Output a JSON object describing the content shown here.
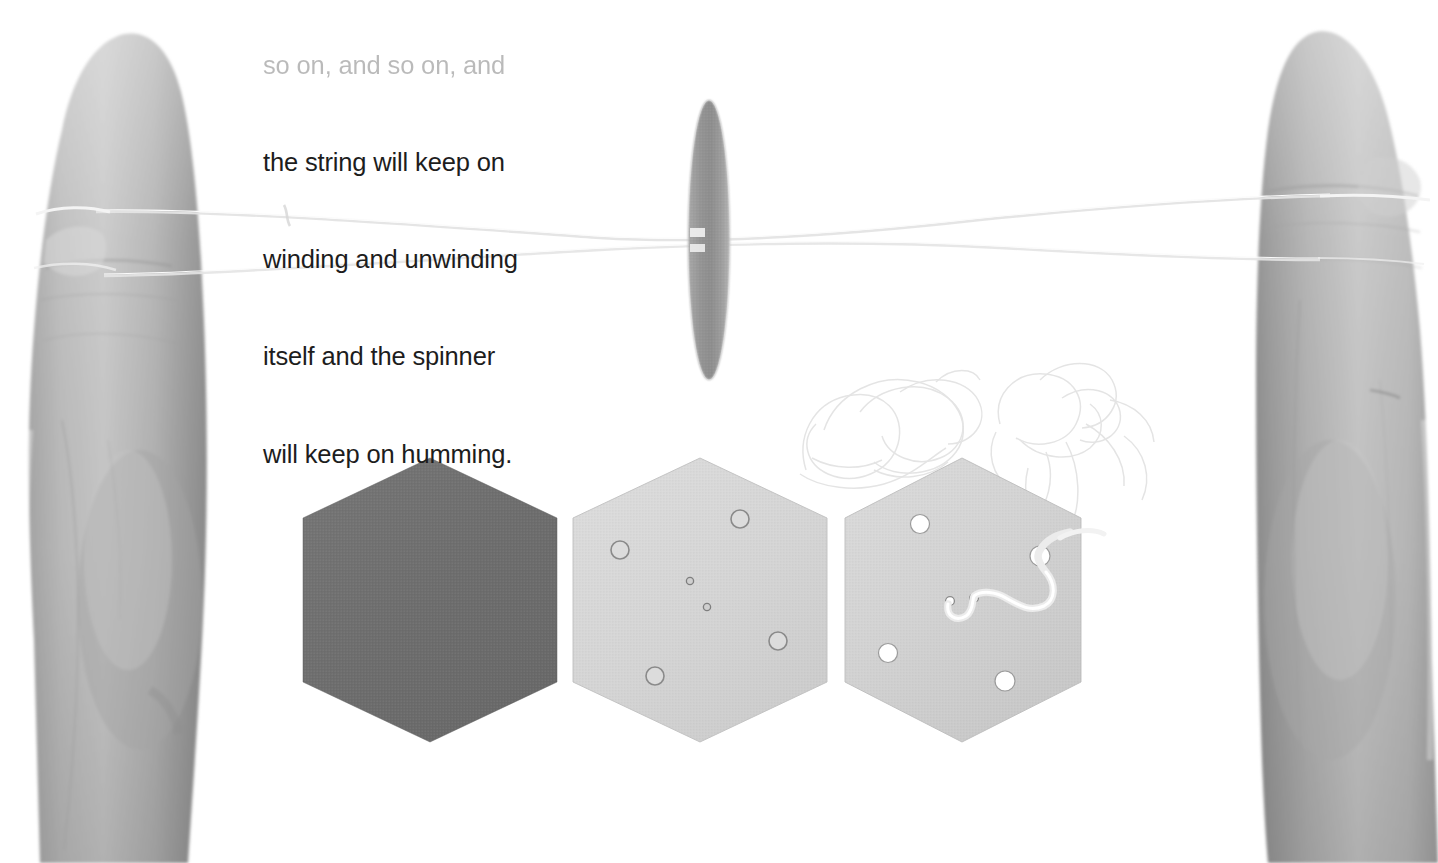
{
  "page": {
    "width": 1438,
    "height": 863,
    "background_color": "#ffffff",
    "kind": "photograph-with-caption"
  },
  "caption": {
    "name": "instruction-caption",
    "color": "#1d1d1d",
    "lines": [
      "the string will keep on",
      "winding and unwinding",
      "itself and the spinner",
      "will keep on humming."
    ],
    "clipped_top_line": "so on, and so on, and"
  },
  "scene": {
    "description": "Two hands holding a looped string; a motion-blurred hexagonal button spinner whirls at the centre; three hexagon cut-outs lie below.",
    "colors": {
      "background": "#ffffff",
      "skin": "#b3b3b3",
      "skin_shadow": "#8d8d8d",
      "skin_highlight": "#d2d2d2",
      "string": "#eeeeee",
      "string_dark": "#dcdcdc",
      "hex_dark": "#6e6e6e",
      "hex_light": "#d6d6d6",
      "hex_light_edge": "#c3c3c3",
      "spinner": "#9c9c9c",
      "hole_ring": "#8a8a8a",
      "hole_fill": "#ffffff"
    },
    "hands": [
      {
        "name": "left-hand",
        "side": "left",
        "x": 0,
        "y": 0,
        "width": 210,
        "height": 863,
        "string_wrap_y": [
          205,
          270
        ]
      },
      {
        "name": "right-hand",
        "side": "right",
        "x": 1248,
        "y": 0,
        "width": 190,
        "height": 863,
        "string_wrap_y": [
          196,
          262
        ]
      }
    ],
    "spinner": {
      "name": "spinning-hexagon-disc",
      "label": "motion-blurred spinning hexagon",
      "cx": 709,
      "cy": 240,
      "rx": 21,
      "ry": 140,
      "color": "#9c9c9c"
    },
    "string": {
      "name": "twisted-string",
      "upper_y_left": 207,
      "upper_y_right": 197,
      "lower_y_left": 272,
      "lower_y_right": 258,
      "color": "#ececec"
    },
    "tangle": {
      "name": "tangled-string-loops",
      "x": 790,
      "y": 365,
      "width": 320,
      "height": 210,
      "color": "#e8e8e8"
    },
    "hexagons": [
      {
        "name": "hexagon-dark-blank",
        "label": "dark grey hexagon, no holes",
        "cx": 430,
        "cy": 600,
        "rx": 127,
        "ry": 142,
        "fill": "#6e6e6e",
        "holes": [],
        "center_holes": [],
        "string_threaded": false
      },
      {
        "name": "hexagon-light-drilled",
        "label": "light grey hexagon with four ring holes and two pin holes",
        "cx": 700,
        "cy": 600,
        "rx": 127,
        "ry": 142,
        "fill": "#d6d6d6",
        "holes": [
          {
            "cx": 740,
            "cy": 519,
            "r": 9
          },
          {
            "cx": 620,
            "cy": 550,
            "r": 9
          },
          {
            "cx": 778,
            "cy": 641,
            "r": 9
          },
          {
            "cx": 655,
            "cy": 676,
            "r": 9
          }
        ],
        "center_holes": [
          {
            "cx": 690,
            "cy": 581,
            "r": 3.5
          },
          {
            "cx": 707,
            "cy": 607,
            "r": 3.5
          }
        ],
        "string_threaded": false
      },
      {
        "name": "hexagon-light-strung",
        "label": "light grey hexagon with four punched holes and string threaded through the centre",
        "cx": 962,
        "cy": 600,
        "rx": 119,
        "ry": 142,
        "fill": "#d4d4d4",
        "holes": [
          {
            "cx": 920,
            "cy": 524,
            "r": 9
          },
          {
            "cx": 1040,
            "cy": 556,
            "r": 10
          },
          {
            "cx": 888,
            "cy": 653,
            "r": 9
          },
          {
            "cx": 1005,
            "cy": 681,
            "r": 10
          }
        ],
        "center_holes": [
          {
            "cx": 950,
            "cy": 601,
            "r": 4
          },
          {
            "cx": 974,
            "cy": 598,
            "r": 4
          }
        ],
        "string_threaded": true
      }
    ]
  }
}
